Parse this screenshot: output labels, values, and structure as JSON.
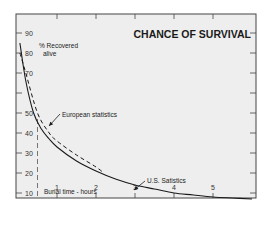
{
  "chart_data": {
    "type": "line",
    "title": "CHANCE OF SURVIVAL",
    "xlabel": "Burial time - hours",
    "ylabel": "% Recovered alive",
    "xlim": [
      0,
      6
    ],
    "ylim": [
      7,
      100
    ],
    "x_ticks": [
      1,
      2,
      3,
      4,
      5
    ],
    "y_ticks": [
      10,
      20,
      30,
      40,
      50,
      70,
      80,
      90
    ],
    "grid": false,
    "legend": null,
    "series": [
      {
        "name": "U.S. Satistics",
        "style": "solid",
        "x": [
          0.05,
          0.2,
          0.4,
          0.6,
          0.8,
          1.0,
          1.5,
          2.0,
          2.5,
          3.0,
          3.5,
          4.0,
          4.5,
          5.0,
          5.5,
          6.0
        ],
        "values": [
          85,
          66,
          50,
          42,
          37,
          33,
          26,
          21,
          17,
          14,
          12,
          10,
          9,
          8,
          7.5,
          7
        ]
      },
      {
        "name": "European statistics",
        "style": "dashed",
        "x": [
          0.05,
          0.2,
          0.5,
          0.8,
          1.0,
          1.5,
          2.0,
          2.2
        ],
        "values": [
          80,
          70,
          50,
          40,
          36,
          29,
          23,
          20
        ]
      }
    ],
    "annotations": [
      {
        "text": "European statistics",
        "arrow_to": {
          "x": 0.55,
          "y": 46
        }
      },
      {
        "text": "U.S. Satistics",
        "arrow_to": {
          "x": 2.95,
          "y": 14
        }
      },
      {
        "text": "Burial time - hours"
      },
      {
        "text": "% Recovered alive"
      }
    ],
    "reference_line": {
      "x": 0.5,
      "style": "dashed",
      "orientation": "vertical"
    }
  },
  "labels": {
    "title": "CHANCE OF SURVIVAL",
    "ylabel_line1": "% Recovered",
    "ylabel_line2": "alive",
    "xlabel": "Burial time - hours",
    "european": "European statistics",
    "us": "U.S. Satistics"
  },
  "colors": {
    "background": "#eeeeee",
    "frame": "#444444",
    "line": "#1a1a1a"
  }
}
